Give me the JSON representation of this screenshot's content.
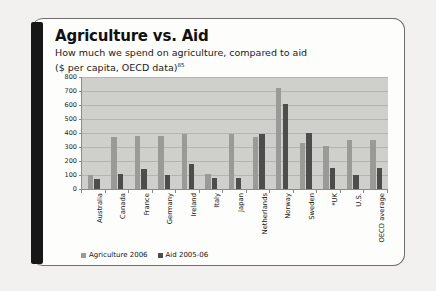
{
  "card": {
    "title": "Agriculture vs. Aid",
    "subtitle_line1": "How much we spend on agriculture, compared to aid",
    "subtitle_line2": "($ per capita, OECD data)",
    "footnote_marker": "85"
  },
  "legend": {
    "agriculture_label": "Agriculture 2006",
    "aid_label": "Aid 2005-06"
  },
  "colors": {
    "agriculture": "#9a9a96",
    "aid": "#4d4d4b",
    "plot_background": "#cfcfcb",
    "card_background": "#fdfdfc",
    "spine": "#171717",
    "gridline": "#b4b4b0",
    "axis": "#8a8a86"
  },
  "chart_data": {
    "type": "bar",
    "title": "Agriculture vs. Aid",
    "subtitle": "How much we spend on agriculture, compared to aid ($ per capita, OECD data)",
    "xlabel": "",
    "ylabel": "",
    "ylim": [
      0,
      800
    ],
    "yticks": [
      0,
      100,
      200,
      300,
      400,
      500,
      600,
      700,
      800
    ],
    "ytick_labels": [
      "0",
      "100",
      "200",
      "300",
      "400",
      "500",
      "600",
      "700",
      "800"
    ],
    "grid": true,
    "legend_position": "bottom-left",
    "categories": [
      "Australia",
      "Canada",
      "France",
      "Germany",
      "Ireland",
      "Italy",
      "Japan",
      "Netherlands",
      "Norway",
      "Sweden",
      "*UK",
      "U.S.",
      "OECD average"
    ],
    "series": [
      {
        "name": "Agriculture 2006",
        "color": "#9a9a96",
        "values": [
          100,
          370,
          380,
          380,
          390,
          110,
          390,
          370,
          720,
          330,
          310,
          350,
          350
        ]
      },
      {
        "name": "Aid 2005-06",
        "color": "#4d4d4b",
        "values": [
          70,
          110,
          140,
          100,
          180,
          80,
          80,
          390,
          610,
          400,
          150,
          100,
          150
        ]
      }
    ]
  }
}
